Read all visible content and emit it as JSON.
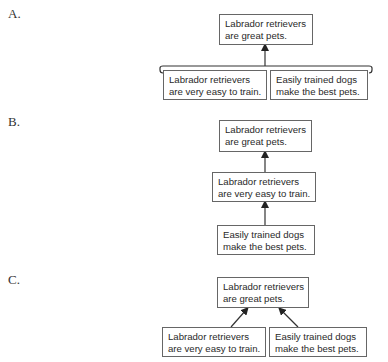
{
  "options": [
    {
      "label": "A.",
      "structure": "convergent (linked premises via bracket)",
      "conclusion": {
        "line1": "Labrador retrievers",
        "line2": "are great pets."
      },
      "premises": [
        {
          "line1": "Labrador retrievers",
          "line2": "are very easy to train."
        },
        {
          "line1": "Easily trained dogs",
          "line2": "make the best pets."
        }
      ]
    },
    {
      "label": "B.",
      "structure": "serial chain",
      "conclusion": {
        "line1": "Labrador retrievers",
        "line2": "are great pets."
      },
      "intermediate": {
        "line1": "Labrador retrievers",
        "line2": "are very easy to train."
      },
      "base": {
        "line1": "Easily trained dogs",
        "line2": "make the best pets."
      }
    },
    {
      "label": "C.",
      "structure": "independent premises (separate arrows)",
      "conclusion": {
        "line1": "Labrador retrievers",
        "line2": "are great pets."
      },
      "premises": [
        {
          "line1": "Labrador retrievers",
          "line2": "are very easy to train."
        },
        {
          "line1": "Easily trained dogs",
          "line2": "make the best pets."
        }
      ]
    }
  ]
}
